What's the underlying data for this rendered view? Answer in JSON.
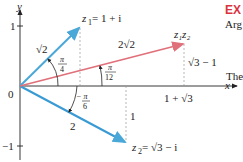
{
  "colors": {
    "z1_vector": "#4aa8d8",
    "z2_vector": "#3a9ad4",
    "product_vector": "#e0707a",
    "axis": "#222222",
    "guide": "#888888",
    "example_heading": "#d9333f"
  },
  "axes": {
    "x_label": "x",
    "y_label": "y",
    "origin_label": "0",
    "y_tick_pos": "1",
    "y_tick_neg": "−1"
  },
  "z1": {
    "label_z": "z",
    "label_sub": "1",
    "label_rest": " = 1 + i",
    "modulus": "√2",
    "angle_num": "π",
    "angle_den": "4"
  },
  "z2": {
    "label_z": "z",
    "label_sub": "2",
    "label_rest": " = √3 − i",
    "modulus": "2",
    "angle_num": "−  π",
    "angle_den": "6",
    "vertical_len": "1"
  },
  "product": {
    "label": "z₁z₂",
    "modulus": "2√2",
    "angle_num": "π",
    "angle_den": "12",
    "x_coord": "1 + √3",
    "y_coord": "√3 − 1"
  },
  "sidebar_text": {
    "heading": "EX",
    "line1": "Arg",
    "line2": "The"
  }
}
